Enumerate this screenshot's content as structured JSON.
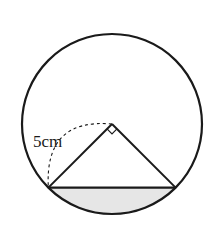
{
  "diagram": {
    "radius_label": "5cm",
    "central_angle_marker": "right-angle",
    "shaded_region": "circular-segment-below-chord",
    "colors": {
      "stroke": "#1a1a1a",
      "shade": "#e6e6e6",
      "background": "#ffffff"
    }
  }
}
